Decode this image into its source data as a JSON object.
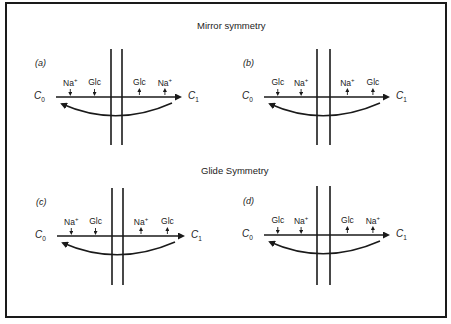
{
  "figure": {
    "border_color": "#1a1a1a",
    "line_color": "#1a1a1a",
    "sections": [
      {
        "title": "Mirror symmetry",
        "panels": [
          {
            "label": "(a)",
            "c0": "C",
            "c0_sub": "0",
            "c1": "C",
            "c1_sub": "1",
            "left_ions": [
              {
                "name": "Na",
                "charge": "+",
                "arrow": "down"
              },
              {
                "name": "Glc",
                "charge": "",
                "arrow": "down"
              }
            ],
            "right_ions": [
              {
                "name": "Glc",
                "charge": "",
                "arrow": "up"
              },
              {
                "name": "Na",
                "charge": "+",
                "arrow": "up"
              }
            ]
          },
          {
            "label": "(b)",
            "c0": "C",
            "c0_sub": "0",
            "c1": "C",
            "c1_sub": "1",
            "left_ions": [
              {
                "name": "Glc",
                "charge": "",
                "arrow": "down"
              },
              {
                "name": "Na",
                "charge": "+",
                "arrow": "down"
              }
            ],
            "right_ions": [
              {
                "name": "Na",
                "charge": "+",
                "arrow": "up"
              },
              {
                "name": "Glc",
                "charge": "",
                "arrow": "up"
              }
            ]
          }
        ]
      },
      {
        "title": "Glide Symmetry",
        "panels": [
          {
            "label": "(c)",
            "c0": "C",
            "c0_sub": "0",
            "c1": "C",
            "c1_sub": "1",
            "left_ions": [
              {
                "name": "Na",
                "charge": "+",
                "arrow": "down"
              },
              {
                "name": "Glc",
                "charge": "",
                "arrow": "down"
              }
            ],
            "right_ions": [
              {
                "name": "Na",
                "charge": "+",
                "arrow": "up"
              },
              {
                "name": "Glc",
                "charge": "",
                "arrow": "up"
              }
            ]
          },
          {
            "label": "(d)",
            "c0": "C",
            "c0_sub": "0",
            "c1": "C",
            "c1_sub": "1",
            "left_ions": [
              {
                "name": "Glc",
                "charge": "",
                "arrow": "down"
              },
              {
                "name": "Na",
                "charge": "+",
                "arrow": "down"
              }
            ],
            "right_ions": [
              {
                "name": "Glc",
                "charge": "",
                "arrow": "up"
              },
              {
                "name": "Na",
                "charge": "+",
                "arrow": "up"
              }
            ]
          }
        ]
      }
    ]
  }
}
